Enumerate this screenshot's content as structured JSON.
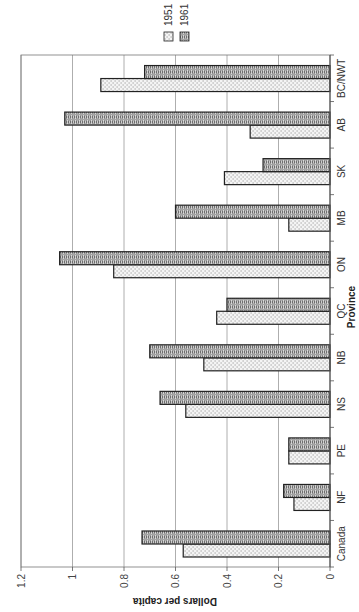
{
  "chart_data": {
    "type": "bar",
    "orientation": "rotated -90deg (vertical bars displayed sideways)",
    "title": "",
    "xlabel": "Province",
    "ylabel": "Dollars per capita",
    "categories": [
      "Canada",
      "NF",
      "PE",
      "NS",
      "NB",
      "QC",
      "ON",
      "MB",
      "SK",
      "AB",
      "BC/NWT"
    ],
    "series": [
      {
        "name": "1951",
        "pattern": "dotted",
        "values": [
          0.57,
          0.14,
          0.16,
          0.56,
          0.49,
          0.44,
          0.84,
          0.16,
          0.41,
          0.31,
          0.89
        ]
      },
      {
        "name": "1961",
        "pattern": "zigzag",
        "values": [
          0.73,
          0.18,
          0.16,
          0.66,
          0.7,
          0.4,
          1.05,
          0.6,
          0.26,
          1.03,
          0.72
        ]
      }
    ],
    "ylim": [
      0,
      1.2
    ],
    "yticks": [
      "0",
      "0.2",
      "0.4",
      "0.6",
      "0.8",
      "1",
      "1.2"
    ],
    "grid": true,
    "legend_position": "right (appears top after rotation)"
  },
  "colors": {
    "axis": "#555555",
    "grid": "#999999",
    "bar_outline": "#222222",
    "pattern_1951_bg": "#f4f4f4",
    "pattern_1951_dot": "#777777",
    "pattern_1961_bg": "#d8d8d8",
    "pattern_1961_line": "#444444"
  }
}
